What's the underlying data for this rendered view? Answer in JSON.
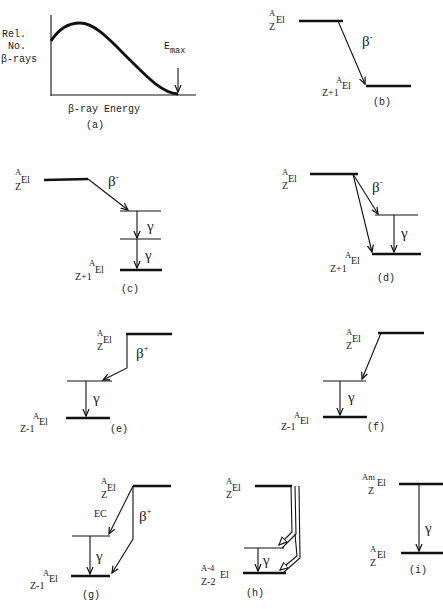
{
  "panels": {
    "a": {
      "caption": "(a)",
      "ylabel_lines": [
        "Rel.",
        "No.",
        "β-rays"
      ],
      "xlabel": "β-ray Energy",
      "emax_label": "E",
      "emax_sub": "max"
    },
    "b": {
      "caption": "(b)",
      "parent": {
        "A": "A",
        "Z": "Z",
        "El": "El"
      },
      "daughter": {
        "A": "A",
        "Z": "Z+1",
        "El": "El"
      },
      "transition": "β",
      "transition_sup": "-"
    },
    "c": {
      "caption": "(c)",
      "parent": {
        "A": "A",
        "Z": "Z",
        "El": "El"
      },
      "daughter": {
        "A": "A",
        "Z": "Z+1",
        "El": "El"
      },
      "transition": "β",
      "transition_sup": "-",
      "gamma1": "γ",
      "gamma2": "γ"
    },
    "d": {
      "caption": "(d)",
      "parent": {
        "A": "A",
        "Z": "Z",
        "El": "El"
      },
      "daughter": {
        "A": "A",
        "Z": "Z+1",
        "El": "El"
      },
      "transition": "β",
      "transition_sup": "-",
      "gamma": "γ"
    },
    "e": {
      "caption": "(e)",
      "parent": {
        "A": "A",
        "Z": "Z",
        "El": "El"
      },
      "daughter": {
        "A": "A",
        "Z": "Z-1",
        "El": "El"
      },
      "transition": "β",
      "transition_sup": "+",
      "gamma": "γ"
    },
    "f": {
      "caption": "(f)",
      "parent": {
        "A": "A",
        "Z": "Z",
        "El": "El"
      },
      "daughter": {
        "A": "A",
        "Z": "Z-1",
        "El": "El"
      },
      "gamma": "γ"
    },
    "g": {
      "caption": "(g)",
      "parent": {
        "A": "A",
        "Z": "Z",
        "El": "El"
      },
      "daughter": {
        "A": "A",
        "Z": "Z-1",
        "El": "El"
      },
      "ec_label": "EC",
      "transition": "β",
      "transition_sup": "+",
      "gamma": "γ"
    },
    "h": {
      "caption": "(h)",
      "parent": {
        "A": "A",
        "Z": "Z",
        "El": "El"
      },
      "daughter": {
        "A": "A-4",
        "Z": "Z-2",
        "El": "El"
      },
      "gamma": "γ"
    },
    "i": {
      "caption": "(i)",
      "parent": {
        "A": "Am",
        "Z": "Z",
        "El": "El"
      },
      "daughter": {
        "A": "A",
        "Z": "Z",
        "El": "El"
      },
      "gamma": "γ"
    }
  }
}
